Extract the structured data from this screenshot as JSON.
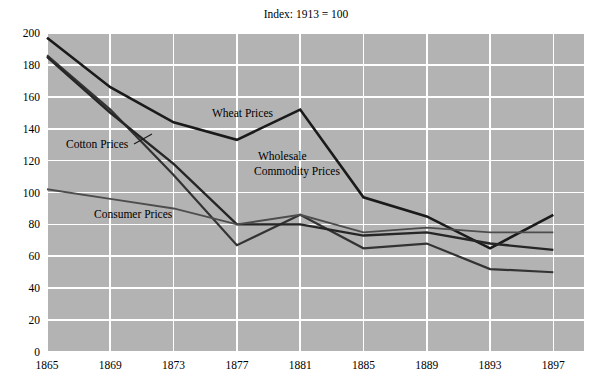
{
  "chart_data": {
    "type": "line",
    "title": "Index: 1913 = 100",
    "xlabel": "",
    "ylabel": "",
    "x": [
      1865,
      1869,
      1873,
      1877,
      1881,
      1885,
      1889,
      1893,
      1897
    ],
    "categories": [
      "1865",
      "1869",
      "1873",
      "1877",
      "1881",
      "1885",
      "1889",
      "1893",
      "1897"
    ],
    "xlim": [
      1865,
      1899
    ],
    "ylim": [
      0,
      200
    ],
    "ytick_labels": [
      "0",
      "20",
      "40",
      "60",
      "80",
      "100",
      "120",
      "140",
      "160",
      "180",
      "200"
    ],
    "ytick_values": [
      0,
      20,
      40,
      60,
      80,
      100,
      120,
      140,
      160,
      180,
      200
    ],
    "grid": true,
    "legend_position": "inline-annotations",
    "plot_background_color": "#b3b3b3",
    "gridline_color": "#ffffff",
    "series": [
      {
        "name": "Wheat Prices",
        "color": "#1a1a1a",
        "width": 2.6,
        "values": [
          197,
          166,
          144,
          133,
          152,
          97,
          85,
          65,
          86
        ],
        "label": "Wheat Prices",
        "label_x": 212,
        "label_y": 117,
        "label_anchor": "start"
      },
      {
        "name": "Cotton Prices",
        "color": "#333333",
        "width": 2.2,
        "values": [
          186,
          152,
          111,
          67,
          86,
          65,
          68,
          52,
          50
        ],
        "label": "Cotton Prices",
        "label_x": 66,
        "label_y": 148,
        "label_anchor": "start"
      },
      {
        "name": "Wholesale Commodity Prices",
        "color": "#262626",
        "width": 2.4,
        "values": [
          185,
          150,
          118,
          80,
          80,
          73,
          75,
          68,
          64
        ],
        "label": "Wholesale",
        "label_line_2": "Commodity Prices",
        "label_x": 258,
        "label_y": 160,
        "label_anchor": "start"
      },
      {
        "name": "Consumer Prices",
        "color": "#4d4d4d",
        "width": 1.9,
        "values": [
          102,
          96,
          90,
          80,
          86,
          75,
          78,
          75,
          75
        ],
        "label": "Consumer Prices",
        "label_x": 94,
        "label_y": 218,
        "label_anchor": "start"
      }
    ],
    "annotations": [
      {
        "name": "cotton-leader",
        "x1": 134,
        "y1": 144,
        "x2": 152,
        "y2": 134
      }
    ]
  }
}
